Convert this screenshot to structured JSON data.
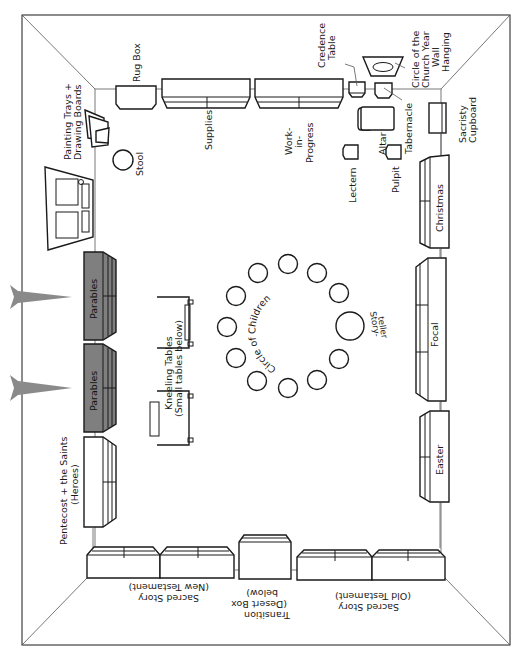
{
  "diagram": {
    "colors": {
      "line": "#1a1a1a",
      "shelf_highlight": "#7f7f7f",
      "arrow": "#8a8a8a",
      "background": "#ffffff"
    },
    "top_wall": {
      "rug_box": "Rug Box",
      "supplies": "Supplies",
      "work_in_progress": [
        "Work-",
        "in-",
        "Progress"
      ],
      "credence_table": [
        "Credence",
        "Table"
      ],
      "wall_hanging": [
        "Circle of the",
        "Church Year",
        "Wall",
        "Hanging"
      ],
      "tabernacle": "Tabernacle",
      "altar": "Altar",
      "lectern": "Lectern",
      "pulpit": "Pulpit",
      "sacristy_cupboard": [
        "Sacristy",
        "Cupboard"
      ]
    },
    "left_wall": {
      "painting_trays": [
        "Painting Trays +",
        "Drawing Boards"
      ],
      "stool": "Stool",
      "door": "door",
      "parables_1": "Parables",
      "parables_2": "Parables",
      "pentecost": [
        "Pentecost + the Saints",
        "(Heroes)"
      ]
    },
    "right_wall": {
      "christmas": "Christmas",
      "focal": "Focal",
      "easter": "Easter"
    },
    "bottom_wall": {
      "sacred_story_nt": [
        "Sacred Story",
        "(New Testament)"
      ],
      "transition": [
        "Transition",
        "(Desert Box",
        "below)"
      ],
      "sacred_story_ot": [
        "Sacred Story",
        "(Old Testament)"
      ]
    },
    "center": {
      "kneeling_tables": [
        "Kneeling Tables",
        "(Small tables below)"
      ],
      "circle_of_children": "Circle of Children",
      "storyteller": [
        "Story-",
        "teller"
      ],
      "children_seats": 11
    },
    "arrows": 2
  }
}
